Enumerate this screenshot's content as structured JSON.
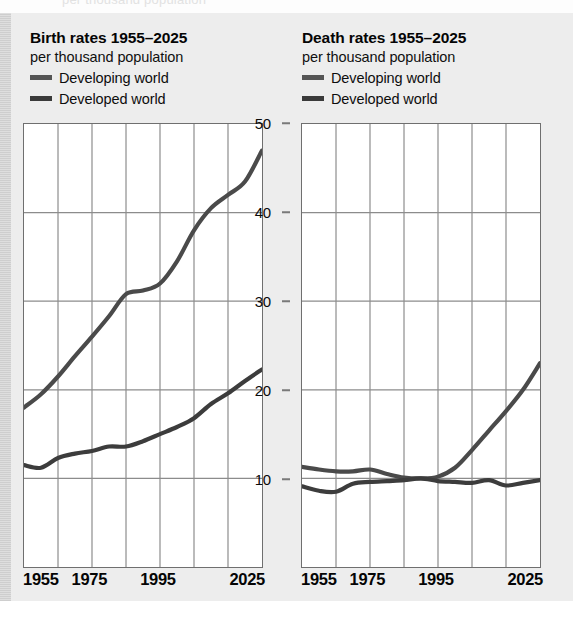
{
  "page": {
    "bleed_text": "per thousand population",
    "background_color": "#ededed",
    "plot_background_color": "#ffffff",
    "frame_color": "#6f6f6f",
    "grid_color": "#8c8c8c",
    "line_color_developing": "#4a4a4a",
    "line_color_developed": "#3c3c3c"
  },
  "panels": [
    {
      "id": "birth",
      "title": "Birth rates 1955–2025",
      "subtitle": "per thousand population",
      "legend": [
        {
          "label": "Developing world",
          "color": "#555555",
          "swatch": "legend-swatch-developing"
        },
        {
          "label": "Developed world",
          "color": "#3a3a3a",
          "swatch": "legend-swatch-developed"
        }
      ],
      "xticks": [
        "1955",
        "1975",
        "1995",
        "2025"
      ]
    },
    {
      "id": "death",
      "title": "Death rates 1955–2025",
      "subtitle": "per thousand population",
      "legend": [
        {
          "label": "Developing world",
          "color": "#555555",
          "swatch": "legend-swatch-developing"
        },
        {
          "label": "Developed world",
          "color": "#3a3a3a",
          "swatch": "legend-swatch-developed"
        }
      ],
      "xticks": [
        "1955",
        "1975",
        "1995",
        "2025"
      ]
    }
  ],
  "yaxis": {
    "ticks": [
      "50",
      "40",
      "30",
      "20",
      "10"
    ],
    "values": [
      50,
      40,
      30,
      20,
      10
    ]
  },
  "chart_data": [
    {
      "type": "line",
      "title": "Birth rates 1955–2025",
      "subtitle": "per thousand population",
      "xlabel": "",
      "ylabel": "per thousand population",
      "xlim": [
        1955,
        2025
      ],
      "ylim": [
        0,
        50
      ],
      "yticks": [
        10,
        20,
        30,
        40,
        50
      ],
      "xticks": [
        1955,
        1975,
        1995,
        2025
      ],
      "xgrid_every": 10,
      "grid": true,
      "legend_position": "above-plot",
      "series": [
        {
          "name": "Developing world",
          "color": "#4a4a4a",
          "x": [
            1955,
            1960,
            1965,
            1970,
            1975,
            1980,
            1985,
            1990,
            1995,
            2000,
            2005,
            2010,
            2015,
            2020,
            2025
          ],
          "values": [
            18.0,
            19.5,
            21.5,
            23.8,
            26.0,
            28.3,
            30.8,
            31.2,
            32.0,
            34.5,
            38.0,
            40.5,
            42.0,
            43.5,
            47.0
          ]
        },
        {
          "name": "Developed world",
          "color": "#3c3c3c",
          "x": [
            1955,
            1960,
            1965,
            1970,
            1975,
            1980,
            1985,
            1990,
            1995,
            2000,
            2005,
            2010,
            2015,
            2020,
            2025
          ],
          "values": [
            11.5,
            11.2,
            12.3,
            12.8,
            13.1,
            13.6,
            13.6,
            14.2,
            15.0,
            15.8,
            16.8,
            18.4,
            19.6,
            21.0,
            22.3
          ]
        }
      ]
    },
    {
      "type": "line",
      "title": "Death rates 1955–2025",
      "subtitle": "per thousand population",
      "xlabel": "",
      "ylabel": "per thousand population",
      "xlim": [
        1955,
        2025
      ],
      "ylim": [
        0,
        50
      ],
      "yticks": [
        10,
        20,
        30,
        40,
        50
      ],
      "xticks": [
        1955,
        1975,
        1995,
        2025
      ],
      "xgrid_every": 10,
      "grid": true,
      "legend_position": "above-plot",
      "series": [
        {
          "name": "Developing world",
          "color": "#4a4a4a",
          "x": [
            1955,
            1960,
            1965,
            1970,
            1975,
            1980,
            1985,
            1990,
            1995,
            2000,
            2005,
            2010,
            2015,
            2020,
            2025
          ],
          "values": [
            11.3,
            11.0,
            10.8,
            10.8,
            11.0,
            10.5,
            10.1,
            10.0,
            10.2,
            11.2,
            13.2,
            15.4,
            17.6,
            20.0,
            23.0
          ]
        },
        {
          "name": "Developed world",
          "color": "#3c3c3c",
          "x": [
            1955,
            1960,
            1965,
            1970,
            1975,
            1980,
            1985,
            1990,
            1995,
            2000,
            2005,
            2010,
            2015,
            2020,
            2025
          ],
          "values": [
            9.1,
            8.6,
            8.5,
            9.4,
            9.6,
            9.7,
            9.8,
            10.0,
            9.7,
            9.6,
            9.5,
            9.8,
            9.2,
            9.5,
            9.8
          ]
        }
      ]
    }
  ]
}
